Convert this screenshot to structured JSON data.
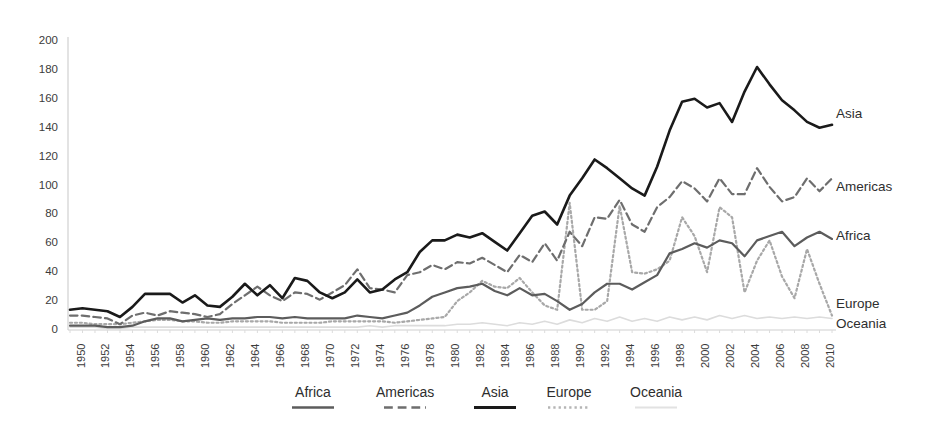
{
  "chart_data": {
    "type": "line",
    "title": "",
    "subtitle": "",
    "xlabel": "",
    "ylabel": "",
    "xlim": [
      1950,
      2011
    ],
    "ylim": [
      0,
      200
    ],
    "ytick_step": 20,
    "xtick_step": 2,
    "grid": false,
    "legend_position": "bottom",
    "yticks": [
      "200",
      "180",
      "160",
      "140",
      "120",
      "100",
      "80",
      "60",
      "40",
      "20",
      "0"
    ],
    "xticks": [
      "1950",
      "1952",
      "1954",
      "1956",
      "1958",
      "1960",
      "1962",
      "1964",
      "1966",
      "1968",
      "1970",
      "1972",
      "1974",
      "1976",
      "1978",
      "1980",
      "1982",
      "1984",
      "1986",
      "1988",
      "1990",
      "1992",
      "1994",
      "1996",
      "1998",
      "2000",
      "2002",
      "2004",
      "2006",
      "2008",
      "2010"
    ],
    "x": [
      1950,
      1951,
      1952,
      1953,
      1954,
      1955,
      1956,
      1957,
      1958,
      1959,
      1960,
      1961,
      1962,
      1963,
      1964,
      1965,
      1966,
      1967,
      1968,
      1969,
      1970,
      1971,
      1972,
      1973,
      1974,
      1975,
      1976,
      1977,
      1978,
      1979,
      1980,
      1981,
      1982,
      1983,
      1984,
      1985,
      1986,
      1987,
      1988,
      1989,
      1990,
      1991,
      1992,
      1993,
      1994,
      1995,
      1996,
      1997,
      1998,
      1999,
      2000,
      2001,
      2002,
      2003,
      2004,
      2005,
      2006,
      2007,
      2008,
      2009,
      2010,
      2011
    ],
    "series": [
      {
        "name": "Asia",
        "color": "#1a1a1a",
        "style": "solid",
        "width": 2.6,
        "values": [
          14,
          15,
          14,
          13,
          9,
          16,
          25,
          25,
          25,
          19,
          24,
          17,
          16,
          23,
          32,
          24,
          31,
          22,
          36,
          34,
          26,
          22,
          26,
          35,
          26,
          28,
          35,
          40,
          54,
          62,
          62,
          66,
          64,
          67,
          61,
          55,
          67,
          79,
          82,
          73,
          93,
          105,
          118,
          112,
          105,
          98,
          93,
          113,
          138,
          158,
          160,
          154,
          157,
          144,
          165,
          182,
          170,
          159,
          152,
          144,
          140,
          142
        ]
      },
      {
        "name": "Americas",
        "color": "#6e6e6e",
        "style": "dashed",
        "width": 2.2,
        "values": [
          10,
          10,
          9,
          8,
          4,
          10,
          12,
          10,
          13,
          12,
          11,
          9,
          11,
          18,
          24,
          30,
          24,
          20,
          26,
          25,
          21,
          26,
          31,
          42,
          29,
          28,
          26,
          38,
          40,
          45,
          42,
          47,
          46,
          50,
          45,
          40,
          52,
          47,
          60,
          48,
          68,
          58,
          78,
          77,
          90,
          73,
          68,
          85,
          92,
          103,
          98,
          89,
          105,
          94,
          94,
          112,
          99,
          89,
          92,
          105,
          96,
          105
        ]
      },
      {
        "name": "Africa",
        "color": "#5c5c5c",
        "style": "solid",
        "width": 2.2,
        "values": [
          3,
          3,
          3,
          2,
          2,
          3,
          6,
          8,
          8,
          6,
          7,
          8,
          7,
          8,
          8,
          9,
          9,
          8,
          9,
          8,
          8,
          8,
          8,
          10,
          9,
          8,
          10,
          12,
          17,
          23,
          26,
          29,
          30,
          32,
          27,
          24,
          29,
          24,
          25,
          20,
          14,
          18,
          26,
          32,
          32,
          28,
          33,
          38,
          53,
          56,
          60,
          57,
          62,
          60,
          51,
          62,
          65,
          68,
          58,
          64,
          68,
          63
        ]
      },
      {
        "name": "Europe",
        "color": "#a8a8a8",
        "style": "dotted",
        "width": 2.2,
        "values": [
          5,
          5,
          4,
          4,
          4,
          5,
          6,
          7,
          7,
          6,
          6,
          5,
          5,
          6,
          6,
          6,
          6,
          5,
          5,
          5,
          5,
          6,
          6,
          6,
          6,
          6,
          5,
          6,
          7,
          8,
          9,
          20,
          26,
          34,
          30,
          29,
          36,
          26,
          17,
          14,
          88,
          14,
          14,
          20,
          86,
          40,
          39,
          42,
          48,
          78,
          65,
          40,
          85,
          78,
          26,
          48,
          62,
          37,
          22,
          56,
          32,
          10
        ]
      },
      {
        "name": "Oceania",
        "color": "#dcdcdc",
        "style": "solid",
        "width": 1.6,
        "values": [
          2,
          2,
          2,
          1,
          1,
          2,
          2,
          2,
          2,
          2,
          2,
          2,
          2,
          2,
          2,
          2,
          2,
          2,
          2,
          2,
          2,
          2,
          2,
          2,
          3,
          2,
          3,
          3,
          3,
          3,
          3,
          4,
          4,
          5,
          4,
          3,
          5,
          4,
          6,
          4,
          7,
          5,
          8,
          6,
          9,
          6,
          8,
          6,
          9,
          7,
          9,
          7,
          10,
          8,
          10,
          8,
          9,
          8,
          9,
          8,
          9,
          8
        ]
      }
    ],
    "end_labels": [
      {
        "name": "Asia",
        "y_px": 115
      },
      {
        "name": "Americas",
        "y_px": 188
      },
      {
        "name": "Africa",
        "y_px": 237
      },
      {
        "name": "Europe",
        "y_px": 305
      },
      {
        "name": "Oceania",
        "y_px": 325
      }
    ],
    "legend": [
      {
        "label": "Africa",
        "color": "#5c5c5c",
        "style": "solid",
        "width": 2.6,
        "x_px": 22
      },
      {
        "label": "Americas",
        "color": "#6e6e6e",
        "style": "dashed",
        "width": 2.6,
        "x_px": 108
      },
      {
        "label": "Asia",
        "color": "#1a1a1a",
        "style": "solid",
        "width": 3.2,
        "x_px": 204
      },
      {
        "label": "Europe",
        "color": "#b5b5b5",
        "style": "dotted",
        "width": 2.4,
        "x_px": 278
      },
      {
        "label": "Oceania",
        "color": "#e2e2e2",
        "style": "solid",
        "width": 2.0,
        "x_px": 362
      }
    ],
    "axis_color": "#d0d0d0",
    "text_color": "#3b3b3b"
  }
}
